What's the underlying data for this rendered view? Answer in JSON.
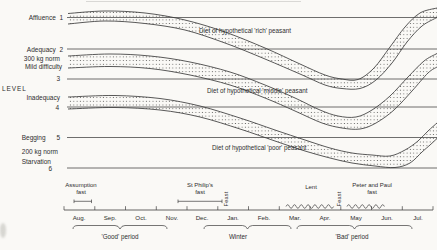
{
  "y_axis": {
    "level_word": "LEVEL",
    "rows": [
      "Affluence  1",
      "Adequacy  2",
      "300 kg norm",
      "Mild difficulty",
      "3",
      "Inadequacy",
      "4",
      "Begging      5",
      "200 kg norm",
      "Starvation",
      "6"
    ]
  },
  "x_axis": {
    "months": [
      "Aug.",
      "Sep.",
      "Oct.",
      "Nov.",
      "Dec.",
      "Jan.",
      "Feb.",
      "Mar.",
      "Apr.",
      "May",
      "Jun.",
      "Jul."
    ],
    "fasts": {
      "assumption": [
        "Assumption",
        "fast"
      ],
      "st_philips": [
        "St Philip's",
        "fast"
      ],
      "lent": "Lent",
      "feast_label": "Feast",
      "peter_and_paul": [
        "Peter and Paul",
        "fast"
      ]
    },
    "periods": [
      "'Good' period",
      "Winter",
      "'Bad' period"
    ]
  },
  "chart_data": {
    "type": "area",
    "x_categories": [
      "Aug.",
      "Sep.",
      "Oct.",
      "Nov.",
      "Dec.",
      "Jan.",
      "Feb.",
      "Mar.",
      "Apr.",
      "May",
      "Jun.",
      "Jul."
    ],
    "ylabel": "LEVEL",
    "y_levels": [
      {
        "level": 1,
        "label": "Affluence"
      },
      {
        "level": 2,
        "label": "Adequacy"
      },
      {
        "level": 3,
        "label": "Mild difficulty",
        "norm": "300 kg norm"
      },
      {
        "level": 4,
        "label": "Inadequacy"
      },
      {
        "level": 5,
        "label": "Begging"
      },
      {
        "level": 6,
        "label": "Starvation",
        "norm": "200 kg norm"
      }
    ],
    "orientation": "level 1 (Affluence) at top, level 6 (Starvation) at bottom; bands dip toward starvation in spring and recover after July",
    "series": [
      {
        "name": "Diet of hypothetical 'rich' peasant",
        "level_by_month": [
          1.1,
          1.0,
          1.0,
          1.2,
          1.5,
          1.9,
          2.3,
          2.8,
          3.2,
          3.2,
          2.5,
          1.3
        ]
      },
      {
        "name": "Diet of hypothetical 'middle' peasant",
        "level_by_month": [
          2.5,
          2.5,
          2.5,
          2.6,
          2.8,
          3.1,
          3.5,
          3.8,
          4.4,
          4.5,
          4.1,
          3.0
        ]
      },
      {
        "name": "Diet of hypothetical 'poor' peasant",
        "level_by_month": [
          3.9,
          3.8,
          3.8,
          3.9,
          4.2,
          4.5,
          4.8,
          5.1,
          5.4,
          5.6,
          5.8,
          5.3
        ]
      }
    ],
    "annotations": {
      "fasts": [
        "Assumption fast (Aug)",
        "St Philip's fast (Nov-Dec)",
        "Lent (Mar-Apr)",
        "Peter and Paul fast (May-Jun)"
      ],
      "feasts": [
        "Feast (after St Philip's fast)",
        "Feast (after Lent)"
      ],
      "periods": [
        {
          "label": "'Good' period",
          "months": "Aug-Oct"
        },
        {
          "label": "Winter",
          "months": "Dec-Feb"
        },
        {
          "label": "'Bad' period",
          "months": "Mar-Jul"
        }
      ]
    },
    "gridlines_y_px": [
      17.5,
      49,
      79,
      107,
      137.5,
      168
    ],
    "bands_px": [
      {
        "name": "rich",
        "top": [
          [
            68,
            13.5
          ],
          [
            105,
            11
          ],
          [
            145,
            13
          ],
          [
            185,
            20
          ],
          [
            225,
            32
          ],
          [
            265,
            48
          ],
          [
            300,
            64
          ],
          [
            325,
            75
          ],
          [
            342,
            79
          ],
          [
            358,
            79.5
          ],
          [
            374,
            68
          ],
          [
            390,
            47
          ],
          [
            405,
            27
          ],
          [
            420,
            13
          ],
          [
            437,
            8
          ]
        ],
        "bottom": [
          [
            68,
            24
          ],
          [
            105,
            21
          ],
          [
            145,
            23.5
          ],
          [
            185,
            30
          ],
          [
            225,
            43
          ],
          [
            265,
            59
          ],
          [
            300,
            74
          ],
          [
            325,
            85
          ],
          [
            342,
            88.5
          ],
          [
            360,
            88.5
          ],
          [
            376,
            80
          ],
          [
            392,
            63
          ],
          [
            407,
            42
          ],
          [
            422,
            26
          ],
          [
            437,
            17.5
          ]
        ]
      },
      {
        "name": "middle",
        "top": [
          [
            68,
            56
          ],
          [
            110,
            54
          ],
          [
            150,
            56
          ],
          [
            190,
            62
          ],
          [
            230,
            72
          ],
          [
            265,
            85
          ],
          [
            295,
            98
          ],
          [
            320,
            110
          ],
          [
            338,
            116
          ],
          [
            356,
            117
          ],
          [
            372,
            110
          ],
          [
            390,
            96
          ],
          [
            408,
            77
          ],
          [
            424,
            61
          ],
          [
            437,
            53.5
          ]
        ],
        "bottom": [
          [
            68,
            68
          ],
          [
            110,
            66.5
          ],
          [
            150,
            68.5
          ],
          [
            190,
            75
          ],
          [
            230,
            85
          ],
          [
            265,
            98
          ],
          [
            295,
            111
          ],
          [
            322,
            123
          ],
          [
            342,
            128
          ],
          [
            360,
            129
          ],
          [
            376,
            123
          ],
          [
            394,
            110
          ],
          [
            412,
            91
          ],
          [
            428,
            73
          ],
          [
            437,
            67
          ]
        ]
      },
      {
        "name": "poor",
        "top": [
          [
            68,
            97
          ],
          [
            115,
            95.5
          ],
          [
            160,
            98.5
          ],
          [
            200,
            106
          ],
          [
            240,
            118
          ],
          [
            275,
            130
          ],
          [
            305,
            140
          ],
          [
            330,
            148
          ],
          [
            352,
            153
          ],
          [
            372,
            155
          ],
          [
            390,
            156
          ],
          [
            405,
            150
          ],
          [
            418,
            141
          ],
          [
            428,
            131
          ],
          [
            437,
            123
          ]
        ],
        "bottom": [
          [
            68,
            109
          ],
          [
            115,
            107.5
          ],
          [
            160,
            110
          ],
          [
            200,
            117
          ],
          [
            240,
            129
          ],
          [
            275,
            141
          ],
          [
            305,
            151
          ],
          [
            330,
            158
          ],
          [
            352,
            163
          ],
          [
            375,
            166
          ],
          [
            395,
            167.5
          ],
          [
            410,
            163
          ],
          [
            422,
            152
          ],
          [
            430,
            145
          ],
          [
            437,
            138.5
          ]
        ]
      }
    ]
  }
}
